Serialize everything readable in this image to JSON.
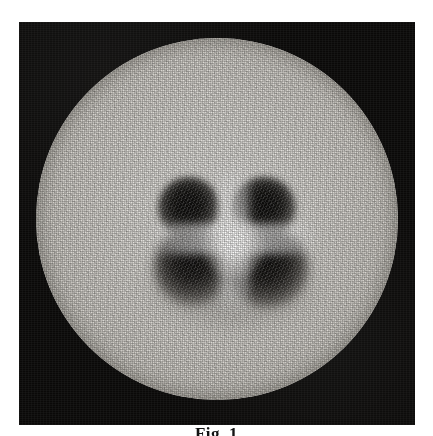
{
  "figure": {
    "caption": "Fig. 1",
    "plate": {
      "name": "photographic-plate",
      "background_color": "#0a0908"
    },
    "field": {
      "name": "illuminated-disc",
      "description": "circular grainy light field",
      "center_x": 217,
      "center_y": 219,
      "radius": 181,
      "base_color": "#dedcd7",
      "rim_color": "#a09c93"
    },
    "pattern": {
      "name": "four-lobe-quadrupole-pattern",
      "lobe_count": 4,
      "dark_color": "#080706",
      "highlight_color": "#ffffff",
      "lobes": [
        {
          "label": "upper-left",
          "center_x": 175,
          "center_y": 192,
          "radius": 31,
          "softness": "sharp"
        },
        {
          "label": "upper-right",
          "center_x": 248,
          "center_y": 192,
          "radius": 32,
          "softness": "sharp"
        },
        {
          "label": "lower-left",
          "center_x": 176,
          "center_y": 248,
          "radius": 38,
          "softness": "soft"
        },
        {
          "label": "lower-right",
          "center_x": 251,
          "center_y": 249,
          "radius": 40,
          "softness": "soft"
        }
      ],
      "separator": "bright cross between lobes"
    }
  }
}
